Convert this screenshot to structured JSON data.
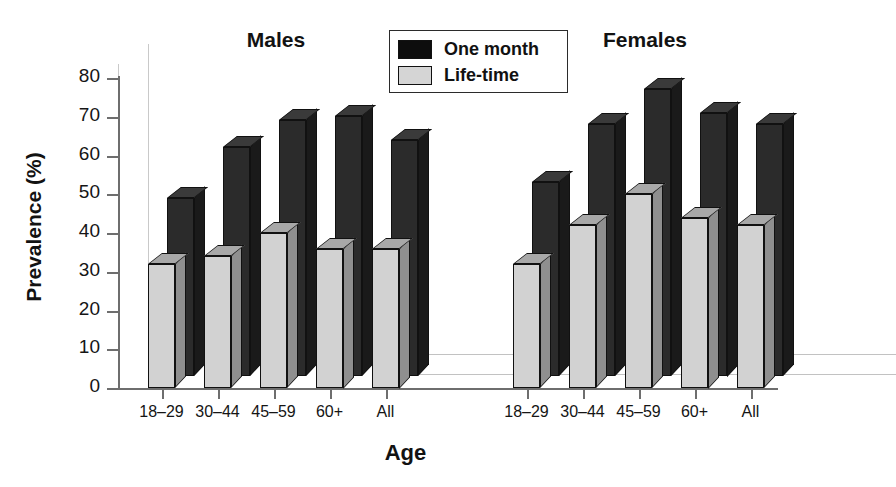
{
  "chart_data": {
    "type": "bar",
    "title": "",
    "xlabel": "Age",
    "ylabel": "Prevalence (%)",
    "ylim": [
      0,
      80
    ],
    "yticks": [
      0,
      10,
      20,
      30,
      40,
      50,
      60,
      70,
      80
    ],
    "grid": false,
    "legend_position": "top-center",
    "categories": [
      "18–29",
      "30–44",
      "45–59",
      "60+",
      "All"
    ],
    "groups": [
      "Males",
      "Females"
    ],
    "series": [
      {
        "name": "One month",
        "color": "#0d0d0d",
        "values_males": [
          46,
          59,
          66,
          67,
          61
        ],
        "values_females": [
          50,
          65,
          74,
          68,
          65
        ]
      },
      {
        "name": "Life-time",
        "color": "#d5d5d5",
        "values_males": [
          32,
          34,
          40,
          36,
          36
        ],
        "values_females": [
          32,
          42,
          50,
          44,
          42
        ]
      }
    ]
  },
  "axis": {
    "y_title": "Prevalence (%)",
    "x_title": "Age",
    "y_tick_labels": [
      "0",
      "10",
      "20",
      "30",
      "40",
      "50",
      "60",
      "70",
      "80"
    ],
    "x_tick_labels_males": [
      "18–29",
      "30–44",
      "45–59",
      "60+",
      "All"
    ],
    "x_tick_labels_females": [
      "18–29",
      "30–44",
      "45–59",
      "60+",
      "All"
    ]
  },
  "group_titles": {
    "males": "Males",
    "females": "Females"
  },
  "legend": {
    "items": [
      {
        "label": "One month",
        "swatch": "dark-swatch"
      },
      {
        "label": "Life-time",
        "swatch": "light-swatch"
      }
    ]
  }
}
